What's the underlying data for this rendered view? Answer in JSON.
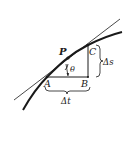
{
  "diagram": {
    "labels": {
      "P": "P",
      "A": "A",
      "B": "B",
      "C": "C",
      "theta": "θ",
      "delta_s": "Δs",
      "delta_t": "Δt"
    },
    "colors": {
      "ink": "#1a1a1a",
      "background": "#ffffff"
    }
  }
}
